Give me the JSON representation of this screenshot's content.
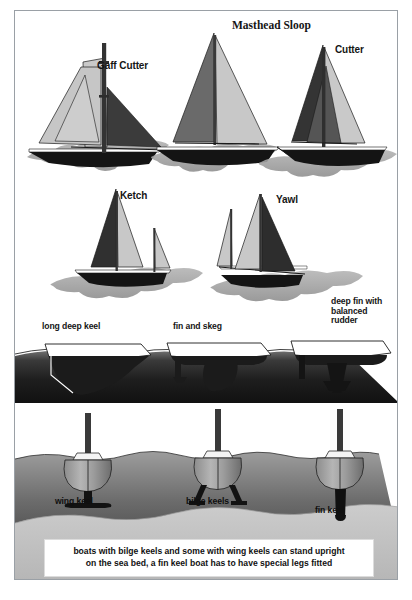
{
  "figure": {
    "title_visible": false,
    "background_color": "#ffffff",
    "frame_border_color": "#9aa0a6"
  },
  "rig_labels": [
    {
      "id": "gaff-cutter",
      "text": "Gaff Cutter",
      "x": 96,
      "y": 59,
      "font": "sans",
      "size": 10
    },
    {
      "id": "masthead-sloop",
      "text": "Masthead Sloop",
      "x": 231,
      "y": 11,
      "font": "serif",
      "size": 11
    },
    {
      "id": "cutter",
      "text": "Cutter",
      "x": 334,
      "y": 43,
      "font": "sans",
      "size": 10
    },
    {
      "id": "ketch",
      "text": "Ketch",
      "x": 119,
      "y": 189,
      "font": "sans",
      "size": 10
    },
    {
      "id": "yawl",
      "text": "Yawl",
      "x": 275,
      "y": 193,
      "font": "sans",
      "size": 10
    }
  ],
  "keel_profile_labels": [
    {
      "id": "long-deep-keel",
      "lines": [
        "long deep keel"
      ],
      "x": 41,
      "y": 318,
      "size": 8.5
    },
    {
      "id": "fin-and-skeg",
      "lines": [
        "fin and skeg"
      ],
      "x": 172,
      "y": 318,
      "size": 8.5
    },
    {
      "id": "deep-fin-balanced-rudder",
      "lines": [
        "deep fin with",
        "balanced",
        "rudder"
      ],
      "x": 330,
      "y": 295,
      "size": 8.5
    }
  ],
  "keel_section_labels": [
    {
      "id": "wing-keel",
      "text": "wing keel",
      "x": 53,
      "y": 494,
      "size": 8.5
    },
    {
      "id": "bilge-keels",
      "text": "bilge keels",
      "x": 185,
      "y": 494,
      "size": 8.5
    },
    {
      "id": "fin-keel",
      "text": "fin keel",
      "x": 314,
      "y": 503,
      "size": 8.5
    }
  ],
  "caption": {
    "line1": "boats with bilge keels and some with wing keels can stand upright",
    "line2": "on the sea bed, a fin keel boat has to have special legs fitted",
    "x": 43,
    "y": 538,
    "width": 330,
    "height": 36,
    "size": 8.6
  },
  "palette": {
    "sail_light": "#c8c8c8",
    "sail_dark": "#6e6e6e",
    "sail_black": "#2b2b2b",
    "hull_black": "#151515",
    "outline": "#1a1a1a",
    "wave_light": "#bdbdbd",
    "wave_mid": "#9a9a9a",
    "seabed_dark": "#2a2a2a",
    "seabed_light": "#cfcfcf",
    "water_grad_top": "#8d8d8d",
    "water_grad_bottom": "#3f3f3f",
    "mast": "#3a3a3a"
  },
  "diagram_sections": [
    {
      "id": "rig-types",
      "description": "five sailing rig silhouettes"
    },
    {
      "id": "keel-profiles",
      "description": "three underwater keel profiles in side view"
    },
    {
      "id": "keel-sections",
      "description": "three boat stern/bow sections showing keel type"
    },
    {
      "id": "caption-strip",
      "description": "explanatory caption strip"
    }
  ]
}
